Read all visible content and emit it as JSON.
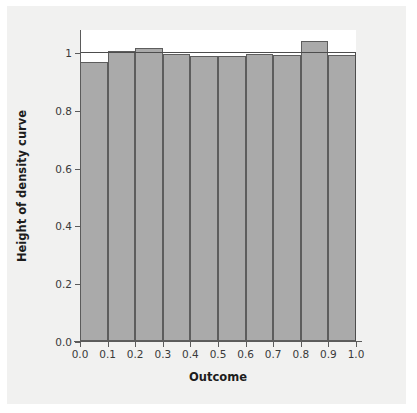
{
  "figure": {
    "background_color": "#f1f1f0",
    "plot_background_color": "#ffffff",
    "bar_fill_color": "#aaaaaa",
    "bar_edge_color": "#5d5d5d",
    "axis_color": "#5b5b5b"
  },
  "chart_data": {
    "type": "bar",
    "title": "",
    "subtitle": "",
    "xlabel": "Outcome",
    "ylabel": "Height of density curve",
    "xlim": [
      0.0,
      1.0
    ],
    "ylim": [
      0.0,
      1.08
    ],
    "grid": false,
    "legend": null,
    "x_tick_labels": [
      "0.0",
      "0.1",
      "0.2",
      "0.3",
      "0.4",
      "0.5",
      "0.6",
      "0.7",
      "0.8",
      "0.9",
      "1.0"
    ],
    "x_tick_values": [
      0.0,
      0.1,
      0.2,
      0.3,
      0.4,
      0.5,
      0.6,
      0.7,
      0.8,
      0.9,
      1.0
    ],
    "y_tick_labels": [
      "0.0",
      "0.2",
      "0.4",
      "0.6",
      "0.8",
      "1"
    ],
    "y_tick_values": [
      0.0,
      0.2,
      0.4,
      0.6,
      0.8,
      1.0
    ],
    "bin_edges": [
      0.0,
      0.1,
      0.2,
      0.3,
      0.4,
      0.5,
      0.6,
      0.7,
      0.8,
      0.9,
      1.0
    ],
    "categories": [
      "0.0-0.1",
      "0.1-0.2",
      "0.2-0.3",
      "0.3-0.4",
      "0.4-0.5",
      "0.5-0.6",
      "0.6-0.7",
      "0.7-0.8",
      "0.8-0.9",
      "0.9-1.0"
    ],
    "values": [
      0.965,
      1.005,
      1.015,
      0.995,
      0.985,
      0.985,
      0.995,
      0.99,
      1.04,
      0.99
    ],
    "annotations": [
      {
        "name": "uniform-density-reference-line",
        "value": 1.0,
        "orientation": "horizontal",
        "label": ""
      }
    ]
  }
}
